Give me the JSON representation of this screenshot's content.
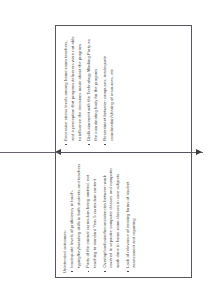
{
  "diagram": {
    "orientation": "text rotated 90 degrees counter-clockwise",
    "connector": {
      "left_arrow_icon": "arrow-left-icon",
      "right_arrow_icon": "arrow-right-icon",
      "line_color": "#6b6370"
    },
    "cells": [
      {
        "id": "unintended-outcomes",
        "heading": "Unintended outcomes:",
        "bullets": [
          "Inadequate levels of proficiency in touch-typing/keyboarding skills in both students and teachers",
          "Parts of the normal curriculum being omitted, not teaching to standard Year 5 curriculum content",
          "Overlap/confusion/inconsistencies between work covered in separate computer classes and computer work done in home-room classes in core subjects",
          "Lack of relevance of existing forms of student assessment and reporting"
        ]
      },
      {
        "id": "stress-and-disillusionment",
        "heading": "",
        "bullets": [
          "Excessive stress levels among home-room teachers, and a perception that program deliverers were not able to influence the decisions made about the program",
          "Disillusionment with the Technology Working Party as the coordinating body for the program",
          "Resentment between campuses, inadequate coordination/sharing of resources, etc"
        ]
      }
    ]
  }
}
